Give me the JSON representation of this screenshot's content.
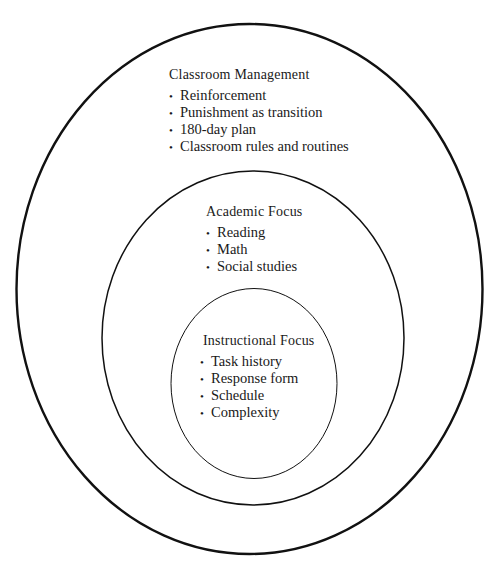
{
  "diagram": {
    "rings": [
      {
        "id": "classroom-management",
        "title": "Classroom Management",
        "items": [
          "Reinforcement",
          "Punishment as transition",
          "180-day plan",
          "Classroom rules and routines"
        ]
      },
      {
        "id": "academic-focus",
        "title": "Academic Focus",
        "items": [
          "Reading",
          "Math",
          "Social studies"
        ]
      },
      {
        "id": "instructional-focus",
        "title": "Instructional Focus",
        "items": [
          "Task history",
          "Response form",
          "Schedule",
          "Complexity"
        ]
      }
    ],
    "bullet": "•",
    "stroke_color": "#111111",
    "background": "#ffffff"
  }
}
